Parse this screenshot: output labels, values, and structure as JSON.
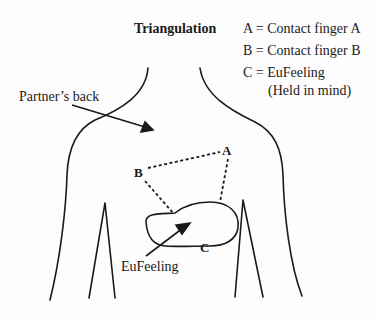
{
  "title": "Triangulation",
  "legend": {
    "items": [
      {
        "label": "A = Contact finger A"
      },
      {
        "label": "B = Contact finger B"
      },
      {
        "label": "C = EuFeeling"
      },
      {
        "label": "(Held in mind)"
      }
    ]
  },
  "annotations": {
    "partners_back": "Partner’s back",
    "eufeeling": "EuFeeling"
  },
  "points": {
    "a": "A",
    "b": "B",
    "c": "C"
  },
  "colors": {
    "stroke": "#1a1a1a",
    "background": "#fdfdfd"
  }
}
